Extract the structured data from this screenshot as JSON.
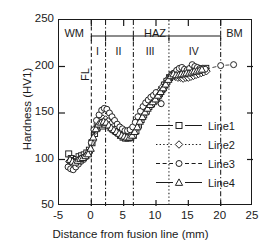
{
  "chart_data": {
    "type": "scatter",
    "title": "",
    "xlabel": "Distance from fusion line (mm)",
    "ylabel": "Hardness (HV1)",
    "xlim": [
      -5,
      25
    ],
    "ylim": [
      50,
      250
    ],
    "xticks": [
      -5,
      0,
      5,
      10,
      15,
      20,
      25
    ],
    "yticks": [
      50,
      100,
      150,
      200,
      250
    ],
    "xtick_labels": [
      "-5",
      "0",
      "5",
      "10",
      "15",
      "20",
      "25"
    ],
    "ytick_labels": [
      "50",
      "100",
      "150",
      "200",
      "250"
    ],
    "grid": false,
    "legend_position": "lower-right-inside",
    "series": [
      {
        "name": "Line1",
        "marker": "square",
        "linestyle": "solid",
        "points": [
          [
            -3.5,
            106
          ],
          [
            -3.1,
            101
          ],
          [
            -2.7,
            99
          ],
          [
            -2.3,
            100
          ],
          [
            -1.9,
            103
          ],
          [
            -1.5,
            104
          ],
          [
            -1.1,
            105
          ],
          [
            -0.7,
            107
          ],
          [
            -0.3,
            110
          ],
          [
            0.1,
            118
          ],
          [
            0.5,
            128
          ],
          [
            0.9,
            134
          ],
          [
            1.3,
            137
          ],
          [
            1.7,
            136
          ],
          [
            2.1,
            138
          ],
          [
            2.5,
            140
          ],
          [
            2.9,
            136
          ],
          [
            3.3,
            133
          ],
          [
            3.7,
            131
          ],
          [
            4.1,
            129
          ],
          [
            4.5,
            126
          ],
          [
            4.9,
            124
          ],
          [
            5.3,
            123
          ],
          [
            5.7,
            123
          ],
          [
            6.1,
            124
          ],
          [
            6.5,
            126
          ],
          [
            6.9,
            131
          ],
          [
            7.3,
            137
          ],
          [
            7.7,
            143
          ],
          [
            8.1,
            148
          ],
          [
            8.5,
            152
          ],
          [
            8.9,
            157
          ],
          [
            9.3,
            160
          ],
          [
            9.7,
            163
          ],
          [
            10.1,
            167
          ],
          [
            10.5,
            171
          ],
          [
            10.9,
            175
          ],
          [
            11.3,
            180
          ],
          [
            11.7,
            184
          ],
          [
            12.1,
            188
          ],
          [
            12.5,
            191
          ],
          [
            12.9,
            192
          ],
          [
            13.3,
            191
          ],
          [
            13.7,
            192
          ],
          [
            14.1,
            193
          ],
          [
            14.5,
            193
          ],
          [
            14.9,
            194
          ],
          [
            15.3,
            194
          ],
          [
            15.7,
            195
          ],
          [
            16.1,
            195
          ],
          [
            16.5,
            196
          ],
          [
            16.9,
            196
          ],
          [
            17.3,
            197
          ],
          [
            17.7,
            198
          ]
        ]
      },
      {
        "name": "Line2",
        "marker": "diamond",
        "linestyle": "dotted",
        "points": [
          [
            -3.4,
            98
          ],
          [
            -3.0,
            96
          ],
          [
            -2.6,
            97
          ],
          [
            -2.2,
            99
          ],
          [
            -1.8,
            100
          ],
          [
            -1.4,
            101
          ],
          [
            -1.0,
            103
          ],
          [
            -0.6,
            105
          ],
          [
            -0.2,
            109
          ],
          [
            0.2,
            120
          ],
          [
            0.6,
            131
          ],
          [
            1.0,
            139
          ],
          [
            1.4,
            142
          ],
          [
            1.8,
            144
          ],
          [
            2.2,
            143
          ],
          [
            2.6,
            141
          ],
          [
            3.0,
            138
          ],
          [
            3.4,
            135
          ],
          [
            3.8,
            133
          ],
          [
            4.2,
            131
          ],
          [
            4.6,
            129
          ],
          [
            5.0,
            127
          ],
          [
            5.4,
            126
          ],
          [
            5.8,
            126
          ],
          [
            6.2,
            128
          ],
          [
            6.6,
            131
          ],
          [
            7.0,
            136
          ],
          [
            7.4,
            142
          ],
          [
            7.8,
            147
          ],
          [
            8.2,
            152
          ],
          [
            8.6,
            156
          ],
          [
            9.0,
            160
          ],
          [
            9.4,
            163
          ],
          [
            9.8,
            166
          ],
          [
            10.2,
            170
          ],
          [
            10.6,
            174
          ],
          [
            11.0,
            178
          ],
          [
            11.4,
            182
          ],
          [
            11.8,
            186
          ],
          [
            12.2,
            189
          ],
          [
            12.6,
            190
          ],
          [
            13.0,
            189
          ],
          [
            13.4,
            188
          ],
          [
            13.8,
            188
          ],
          [
            14.2,
            187
          ],
          [
            14.6,
            188
          ],
          [
            15.0,
            188
          ],
          [
            15.4,
            189
          ],
          [
            15.8,
            190
          ],
          [
            16.2,
            191
          ],
          [
            16.6,
            192
          ],
          [
            17.0,
            193
          ],
          [
            17.4,
            194
          ],
          [
            17.8,
            195
          ]
        ]
      },
      {
        "name": "Line3",
        "marker": "circle",
        "linestyle": "dashed",
        "points": [
          [
            -3.6,
            92
          ],
          [
            -3.2,
            90
          ],
          [
            -2.8,
            89
          ],
          [
            -2.4,
            92
          ],
          [
            -2.0,
            95
          ],
          [
            -1.6,
            98
          ],
          [
            -1.2,
            100
          ],
          [
            -0.8,
            103
          ],
          [
            -0.4,
            108
          ],
          [
            0.0,
            118
          ],
          [
            0.4,
            132
          ],
          [
            0.8,
            142
          ],
          [
            1.2,
            148
          ],
          [
            1.6,
            153
          ],
          [
            2.0,
            155
          ],
          [
            2.4,
            154
          ],
          [
            2.8,
            150
          ],
          [
            3.2,
            146
          ],
          [
            3.6,
            142
          ],
          [
            4.0,
            138
          ],
          [
            4.4,
            135
          ],
          [
            4.8,
            133
          ],
          [
            5.2,
            131
          ],
          [
            5.6,
            131
          ],
          [
            6.0,
            132
          ],
          [
            6.4,
            135
          ],
          [
            6.8,
            140
          ],
          [
            7.2,
            146
          ],
          [
            7.6,
            152
          ],
          [
            8.0,
            157
          ],
          [
            8.4,
            161
          ],
          [
            8.8,
            164
          ],
          [
            9.2,
            167
          ],
          [
            9.6,
            169
          ],
          [
            10.0,
            172
          ],
          [
            10.4,
            168
          ],
          [
            10.8,
            160
          ],
          [
            11.2,
            176
          ],
          [
            11.6,
            182
          ],
          [
            12.0,
            187
          ],
          [
            12.4,
            191
          ],
          [
            12.8,
            193
          ],
          [
            13.2,
            196
          ],
          [
            13.6,
            198
          ],
          [
            14.0,
            199
          ],
          [
            14.4,
            197
          ],
          [
            14.8,
            196
          ],
          [
            15.2,
            198
          ],
          [
            15.6,
            202
          ],
          [
            16.0,
            200
          ],
          [
            16.4,
            199
          ],
          [
            16.8,
            198
          ],
          [
            17.2,
            198
          ],
          [
            17.6,
            197
          ],
          [
            20.0,
            201
          ],
          [
            22.0,
            202
          ]
        ]
      },
      {
        "name": "Line4",
        "marker": "triangle",
        "linestyle": "solid",
        "points": [
          [
            -3.3,
            100
          ],
          [
            -2.9,
            98
          ],
          [
            -2.5,
            97
          ],
          [
            -2.1,
            99
          ],
          [
            -1.7,
            101
          ],
          [
            -1.3,
            102
          ],
          [
            -0.9,
            104
          ],
          [
            -0.5,
            106
          ],
          [
            -0.1,
            112
          ],
          [
            0.3,
            124
          ],
          [
            0.7,
            133
          ],
          [
            1.1,
            138
          ],
          [
            1.5,
            140
          ],
          [
            1.9,
            141
          ],
          [
            2.3,
            140
          ],
          [
            2.7,
            137
          ],
          [
            3.1,
            134
          ],
          [
            3.5,
            132
          ],
          [
            3.9,
            130
          ],
          [
            4.3,
            128
          ],
          [
            4.7,
            126
          ],
          [
            5.1,
            125
          ],
          [
            5.5,
            124
          ],
          [
            5.9,
            124
          ],
          [
            6.3,
            126
          ],
          [
            6.7,
            130
          ],
          [
            7.1,
            135
          ],
          [
            7.5,
            141
          ],
          [
            7.9,
            146
          ],
          [
            8.3,
            151
          ],
          [
            8.7,
            155
          ],
          [
            9.1,
            159
          ],
          [
            9.5,
            162
          ],
          [
            9.9,
            165
          ],
          [
            10.3,
            169
          ],
          [
            10.7,
            173
          ],
          [
            11.1,
            177
          ],
          [
            11.5,
            181
          ],
          [
            11.9,
            186
          ],
          [
            12.3,
            190
          ],
          [
            12.7,
            192
          ],
          [
            13.1,
            191
          ],
          [
            13.5,
            191
          ],
          [
            13.9,
            192
          ],
          [
            14.3,
            192
          ],
          [
            14.7,
            193
          ],
          [
            15.1,
            193
          ],
          [
            15.5,
            194
          ],
          [
            15.9,
            195
          ],
          [
            16.3,
            195
          ],
          [
            16.7,
            196
          ],
          [
            17.1,
            197
          ]
        ]
      }
    ],
    "region_boundaries": [
      {
        "x": 0.0,
        "style": "dashed",
        "label": "FL"
      },
      {
        "x": 2.2,
        "style": "dash-dot"
      },
      {
        "x": 6.5,
        "style": "dash-dot"
      },
      {
        "x": 12.0,
        "style": "dotted"
      },
      {
        "x": 20.0,
        "style": "dash-dot"
      }
    ],
    "region_labels": [
      {
        "text": "WM",
        "x": -2.5
      },
      {
        "text": "HAZ",
        "x": 10.0
      },
      {
        "text": "BM",
        "x": 22.3
      }
    ],
    "subregion_labels": [
      {
        "text": "I",
        "x": 1.1
      },
      {
        "text": "II",
        "x": 4.35
      },
      {
        "text": "III",
        "x": 9.25
      },
      {
        "text": "IV",
        "x": 16.0
      }
    ],
    "haz_bracket": {
      "from": 0.0,
      "to": 20.0,
      "label": "HAZ"
    },
    "vertical_annotation": {
      "text": "FL",
      "x": 0.0
    }
  },
  "legend": {
    "entries": [
      {
        "label": "Line1",
        "marker": "square",
        "linestyle": "solid"
      },
      {
        "label": "Line2",
        "marker": "diamond",
        "linestyle": "dotted"
      },
      {
        "label": "Line3",
        "marker": "circle",
        "linestyle": "dashed"
      },
      {
        "label": "Line4",
        "marker": "triangle",
        "linestyle": "solid"
      }
    ]
  },
  "colors": {
    "axis": "#1a1a1a",
    "marker_stroke": "#1a1a1a",
    "marker_fill": "#ffffff",
    "background": "#ffffff"
  }
}
